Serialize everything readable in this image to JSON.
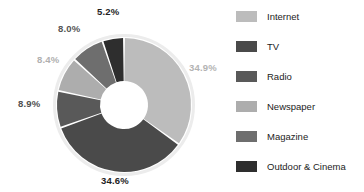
{
  "chart_data": {
    "type": "pie",
    "variant": "donut",
    "title": "",
    "subtitle": "",
    "xlabel": "",
    "ylabel": "",
    "grid": false,
    "legend_position": "right",
    "units": "percent",
    "start_angle_deg": 0,
    "direction": "clockwise",
    "inner_radius_ratio": 0.36,
    "categories": [
      "Internet",
      "TV",
      "Radio",
      "Newspaper",
      "Magazine",
      "Outdoor & Cinema"
    ],
    "values": [
      34.9,
      34.6,
      8.9,
      8.4,
      8.0,
      5.2
    ],
    "value_labels": [
      "34.9%",
      "34.6%",
      "8.9%",
      "8.4%",
      "8.0%",
      "5.2%"
    ],
    "colors": [
      "#bcbcbc",
      "#4a4a4a",
      "#595959",
      "#adadad",
      "#6e6e6e",
      "#2e2e2e"
    ],
    "label_colors": [
      "#b3b3b3",
      "#1e1e1e",
      "#4f4f4f",
      "#b0b0b0",
      "#555555",
      "#1e1e1e"
    ],
    "slices": [
      {
        "name": "Internet",
        "value": 34.9,
        "label": "34.9%",
        "color": "#bcbcbc",
        "label_color": "#b3b3b3"
      },
      {
        "name": "TV",
        "value": 34.6,
        "label": "34.6%",
        "color": "#4a4a4a",
        "label_color": "#1e1e1e"
      },
      {
        "name": "Radio",
        "value": 8.9,
        "label": "8.9%",
        "color": "#595959",
        "label_color": "#4f4f4f"
      },
      {
        "name": "Newspaper",
        "value": 8.4,
        "label": "8.4%",
        "color": "#adadad",
        "label_color": "#b0b0b0"
      },
      {
        "name": "Magazine",
        "value": 8.0,
        "label": "8.0%",
        "color": "#6e6e6e",
        "label_color": "#555555"
      },
      {
        "name": "Outdoor & Cinema",
        "value": 5.2,
        "label": "5.2%",
        "color": "#2e2e2e",
        "label_color": "#1e1e1e"
      }
    ]
  },
  "legend": {
    "items": [
      {
        "label": "Internet",
        "color": "#bcbcbc"
      },
      {
        "label": "TV",
        "color": "#4a4a4a"
      },
      {
        "label": "Radio",
        "color": "#595959"
      },
      {
        "label": "Newspaper",
        "color": "#adadad"
      },
      {
        "label": "Magazine",
        "color": "#6e6e6e"
      },
      {
        "label": "Outdoor & Cinema",
        "color": "#2e2e2e"
      }
    ]
  }
}
